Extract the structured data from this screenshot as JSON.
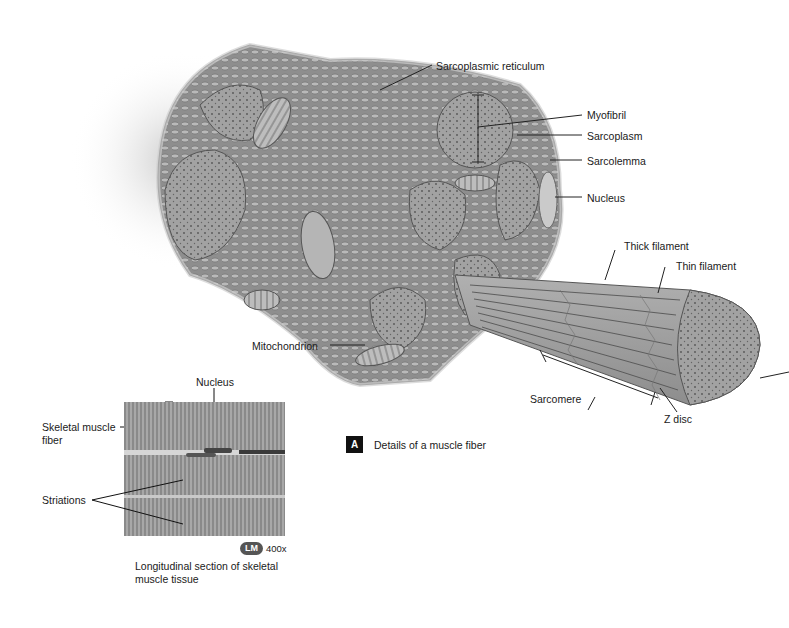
{
  "figure": {
    "panel_letter": "A",
    "panel_caption": "Details of a muscle fiber"
  },
  "labels": {
    "sarcoplasmic_reticulum": "Sarcoplasmic reticulum",
    "myofibril": "Myofibril",
    "sarcoplasm": "Sarcoplasm",
    "sarcolemma": "Sarcolemma",
    "nucleus_top": "Nucleus",
    "thick_filament": "Thick filament",
    "thin_filament": "Thin filament",
    "mitochondrion": "Mitochondrion",
    "sarcomere": "Sarcomere",
    "z_disc": "Z disc"
  },
  "micrograph": {
    "nucleus": "Nucleus",
    "skeletal_muscle_fiber": "Skeletal muscle fiber",
    "skeletal_muscle_fiber_line1": "Skeletal muscle",
    "skeletal_muscle_fiber_line2": "fiber",
    "striations": "Striations",
    "lm_badge": "LM",
    "magnification": "400x",
    "caption_line1": "Longitudinal section of skeletal",
    "caption_line2": "muscle tissue"
  },
  "colors": {
    "tissue": "#9c9c9c",
    "tissue_dark": "#6f6f6f",
    "tissue_light": "#c4c4c4",
    "leader_line": "#222222"
  }
}
